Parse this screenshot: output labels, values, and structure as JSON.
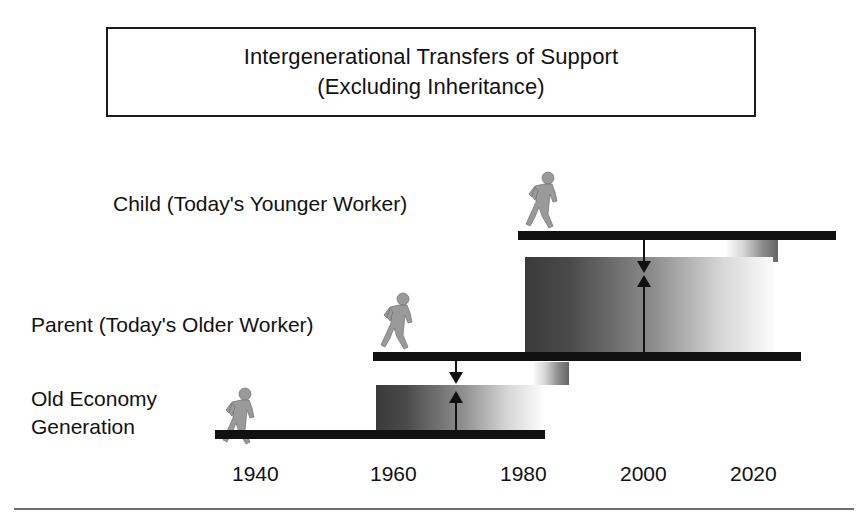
{
  "figure": {
    "title": {
      "line1": "Intergenerational Transfers of Support",
      "line2": "(Excluding Inheritance)"
    },
    "rows": [
      {
        "key": "child",
        "label": "Child (Today's Younger Worker)",
        "icon": "walking-person-icon"
      },
      {
        "key": "parent",
        "label": "Parent (Today's Older Worker)",
        "icon": "walking-person-icon"
      },
      {
        "key": "old_economy",
        "label_line1": "Old Economy",
        "label_line2": "Generation",
        "icon": "walking-person-icon"
      }
    ],
    "axis": {
      "years": [
        "1940",
        "1960",
        "1980",
        "2000",
        "2020"
      ],
      "year_positions_px": [
        232,
        370,
        500,
        620,
        730
      ]
    },
    "transfers": [
      {
        "from": "parent",
        "to": "child",
        "down_arrow": "arrow-down-icon",
        "up_arrow": "arrow-up-icon"
      },
      {
        "from": "old_economy",
        "to": "parent",
        "down_arrow": "arrow-down-icon",
        "up_arrow": "arrow-up-icon"
      }
    ],
    "colors": {
      "ink": "#111111",
      "bar": "#111111",
      "gradient_dark": "#3a3a3a",
      "gradient_light": "#fbfbfb",
      "rule": "#6e6e6e",
      "icon_fill": "#9a9a9a"
    }
  }
}
